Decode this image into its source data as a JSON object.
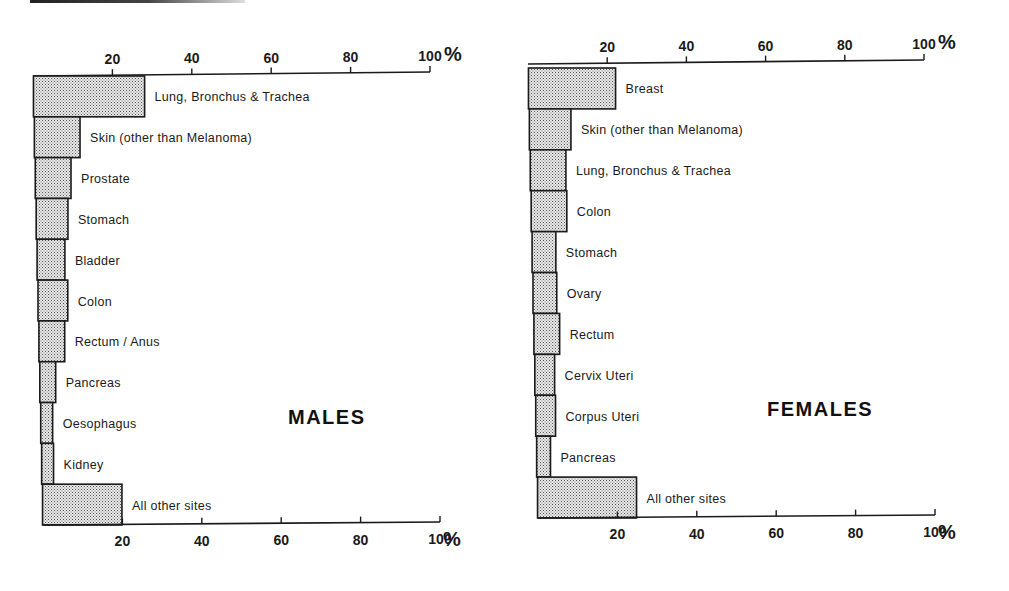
{
  "chart_data": [
    {
      "type": "bar",
      "orientation": "horizontal",
      "title": "MALES",
      "xlabel": "%",
      "ylabel": "",
      "xlim": [
        0,
        100
      ],
      "x_ticks": [
        "20",
        "40",
        "60",
        "80",
        "100"
      ],
      "x_unit": "%",
      "grid": false,
      "categories": [
        "Lung, Bronchus & Trachea",
        "Skin (other than Melanoma)",
        "Prostate",
        "Stomach",
        "Bladder",
        "Colon",
        "Rectum / Anus",
        "Pancreas",
        "Oesophagus",
        "Kidney",
        "All other sites"
      ],
      "values": [
        28,
        11.5,
        9,
        8,
        7,
        7.5,
        6.5,
        4,
        3,
        3,
        20
      ]
    },
    {
      "type": "bar",
      "orientation": "horizontal",
      "title": "FEMALES",
      "xlabel": "%",
      "ylabel": "",
      "xlim": [
        0,
        100
      ],
      "x_ticks": [
        "20",
        "40",
        "60",
        "80",
        "100"
      ],
      "x_unit": "%",
      "grid": false,
      "categories": [
        "Breast",
        "Skin (other than Melanoma)",
        "Lung, Bronchus & Trachea",
        "Colon",
        "Stomach",
        "Ovary",
        "Rectum",
        "Cervix Uteri",
        "Corpus Uteri",
        "Pancreas",
        "All other sites"
      ],
      "values": [
        22,
        10.5,
        9,
        9,
        6,
        6,
        6.5,
        5,
        5,
        3.5,
        25
      ]
    }
  ],
  "style": {
    "bar_fill": "#d9d9d9",
    "bar_stroke": "#1a1a1a",
    "axis_color": "#1a1a1a"
  }
}
